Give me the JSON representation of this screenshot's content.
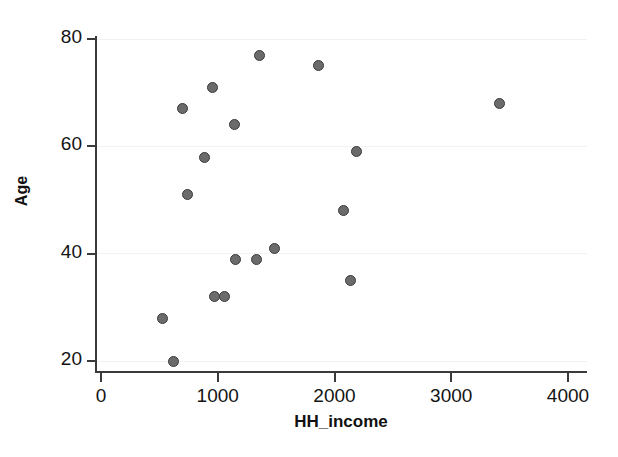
{
  "chart_data": {
    "type": "scatter",
    "title": "",
    "xlabel": "HH_income",
    "ylabel": "Age",
    "xlim": [
      0,
      4000
    ],
    "ylim": [
      20,
      80
    ],
    "xticks": [
      0,
      1000,
      2000,
      3000,
      4000
    ],
    "yticks": [
      20,
      40,
      60,
      80
    ],
    "xtick_labels": [
      "0",
      "1000",
      "2000",
      "3000",
      "4000"
    ],
    "ytick_labels": [
      "20",
      "40",
      "60",
      "80"
    ],
    "grid": "horizontal-light",
    "legend": null,
    "marker": {
      "shape": "circle",
      "fill_color": "#6b6b6b",
      "edge_color": "#3b3b3b",
      "size_px": 11
    },
    "n_points": 18,
    "points": [
      {
        "x": 531,
        "y": 28
      },
      {
        "x": 617,
        "y": 20
      },
      {
        "x": 700,
        "y": 67
      },
      {
        "x": 745,
        "y": 51
      },
      {
        "x": 890,
        "y": 58
      },
      {
        "x": 955,
        "y": 71
      },
      {
        "x": 968,
        "y": 32
      },
      {
        "x": 1062,
        "y": 32
      },
      {
        "x": 1140,
        "y": 64
      },
      {
        "x": 1148,
        "y": 39
      },
      {
        "x": 1336,
        "y": 39
      },
      {
        "x": 1360,
        "y": 77
      },
      {
        "x": 1482,
        "y": 41
      },
      {
        "x": 1860,
        "y": 75
      },
      {
        "x": 2080,
        "y": 48
      },
      {
        "x": 2140,
        "y": 35
      },
      {
        "x": 2190,
        "y": 59
      },
      {
        "x": 3410,
        "y": 68
      }
    ]
  },
  "colors": {
    "axis": "#3a3a3a",
    "grid": "#f2f2f2",
    "text": "#141414",
    "background": "#ffffff"
  }
}
